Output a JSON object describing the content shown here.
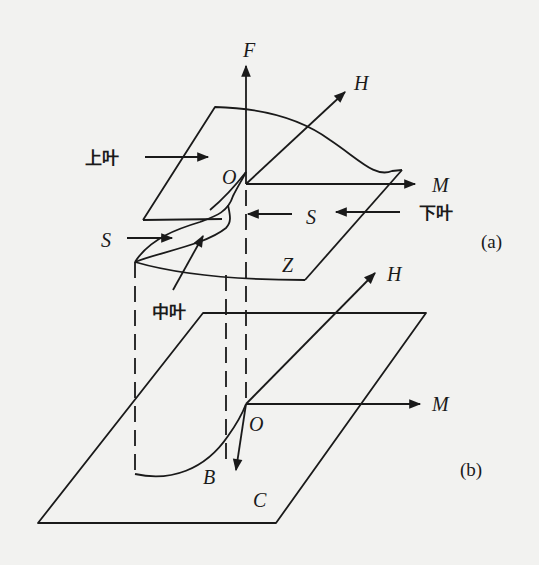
{
  "figure": {
    "background_color": "#f2f2f0",
    "line_color": "#1a1a1a",
    "panels": [
      {
        "id": "a",
        "label": "(a)",
        "axes": {
          "vertical": "F",
          "depth": "H",
          "horizontal": "M",
          "origin": "O"
        },
        "annotations": {
          "upper_leaf": "上叶",
          "middle_leaf": "中叶",
          "lower_leaf": "下叶",
          "sheet_left": "S",
          "sheet_right": "S",
          "surface": "Z"
        }
      },
      {
        "id": "b",
        "label": "(b)",
        "axes": {
          "depth": "H",
          "horizontal": "M",
          "origin": "O"
        },
        "annotations": {
          "bifurcation_curve": "B",
          "control_plane": "C"
        }
      }
    ]
  }
}
